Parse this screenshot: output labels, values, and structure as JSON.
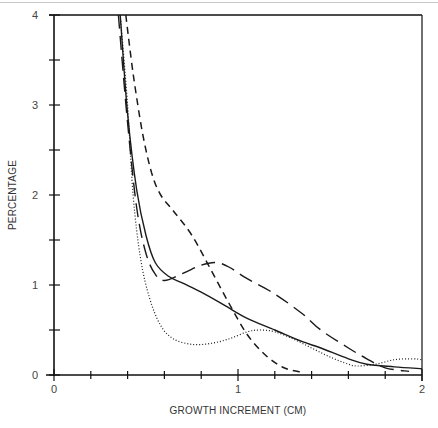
{
  "chart_data": {
    "type": "line",
    "title": "",
    "xlabel": "GROWTH INCREMENT (CM)",
    "ylabel": "PERCENTAGE",
    "xlim": [
      0,
      2
    ],
    "ylim": [
      0,
      4
    ],
    "x_ticks": [
      "0",
      "1",
      "2"
    ],
    "y_ticks": [
      "0",
      "1",
      "2",
      "3",
      "4"
    ],
    "x_minor_step": 0.2,
    "y_minor_step": 0.5,
    "grid": false,
    "legend": null,
    "series": [
      {
        "name": "solid",
        "style": "solid",
        "x": [
          0.36,
          0.4,
          0.45,
          0.5,
          0.55,
          0.62,
          0.7,
          0.8,
          0.93,
          1.05,
          1.2,
          1.35,
          1.45,
          1.6,
          1.7,
          1.85,
          2.0
        ],
        "y": [
          4.0,
          2.9,
          2.05,
          1.55,
          1.25,
          1.1,
          1.02,
          0.92,
          0.77,
          0.63,
          0.5,
          0.37,
          0.3,
          0.18,
          0.12,
          0.09,
          0.07
        ]
      },
      {
        "name": "long-dash",
        "style": "long-dash",
        "x": [
          0.35,
          0.4,
          0.45,
          0.5,
          0.55,
          0.6,
          0.7,
          0.8,
          0.88,
          0.95,
          1.05,
          1.2,
          1.35,
          1.45,
          1.6,
          1.7,
          1.8,
          1.93
        ],
        "y": [
          4.0,
          2.8,
          1.85,
          1.35,
          1.12,
          1.05,
          1.13,
          1.22,
          1.25,
          1.2,
          1.07,
          0.9,
          0.68,
          0.5,
          0.3,
          0.18,
          0.08,
          0.04
        ]
      },
      {
        "name": "short-dash",
        "style": "short-dash",
        "x": [
          0.39,
          0.43,
          0.48,
          0.53,
          0.58,
          0.65,
          0.75,
          0.85,
          0.95,
          1.05,
          1.15,
          1.25,
          1.35
        ],
        "y": [
          4.0,
          3.35,
          2.7,
          2.25,
          2.0,
          1.82,
          1.55,
          1.18,
          0.8,
          0.45,
          0.22,
          0.08,
          0.03
        ]
      },
      {
        "name": "dotted",
        "style": "dotted",
        "x": [
          0.36,
          0.4,
          0.43,
          0.47,
          0.52,
          0.58,
          0.65,
          0.75,
          0.85,
          0.95,
          1.05,
          1.12,
          1.2,
          1.3,
          1.4,
          1.5,
          1.6,
          1.65,
          1.75,
          1.85,
          1.95,
          2.0
        ],
        "y": [
          4.0,
          3.0,
          2.0,
          1.3,
          0.85,
          0.55,
          0.4,
          0.34,
          0.35,
          0.4,
          0.48,
          0.5,
          0.48,
          0.4,
          0.3,
          0.2,
          0.12,
          0.1,
          0.12,
          0.17,
          0.18,
          0.17
        ]
      }
    ]
  }
}
